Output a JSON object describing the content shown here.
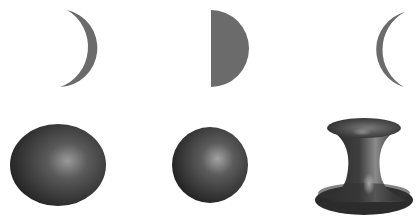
{
  "figure": {
    "width": 419,
    "height": 224,
    "background": "#ffffff",
    "rows": [
      {
        "name": "cross-sections",
        "items": [
          {
            "shape": "crescent-right",
            "fill": "#6b6b6b"
          },
          {
            "shape": "half-disk",
            "fill": "#6b6b6b"
          },
          {
            "shape": "crescent-left",
            "fill": "#6b6b6b"
          }
        ]
      },
      {
        "name": "surfaces",
        "items": [
          {
            "shape": "oblate-ellipsoid",
            "highlight": "#9a9a9a",
            "shadow": "#2a2a2a"
          },
          {
            "shape": "sphere",
            "highlight": "#a0a0a0",
            "shadow": "#2a2a2a"
          },
          {
            "shape": "hyperboloid",
            "highlight": "#a5a5a5",
            "shadow": "#2a2a2a"
          }
        ]
      }
    ]
  }
}
